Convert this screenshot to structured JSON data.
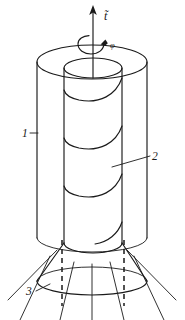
{
  "figure": {
    "caption": "",
    "background_color": "#ffffff",
    "ink_color": "#1a1a1a",
    "width_px": 185,
    "height_px": 320
  },
  "vector": {
    "symbol": "t",
    "accent": "tilde",
    "label": "t̃",
    "name": "axial-vector-t",
    "direction": "up",
    "arrow_tip_y": 8,
    "arrow_base_y": 62
  },
  "rotation": {
    "symbol": "φ",
    "label": "φ",
    "name": "rotation-angle-phi",
    "description": "curved arrow about the vertical axis"
  },
  "callouts": [
    {
      "id": "1",
      "label": "1",
      "name": "callout-1-outer-cylinder",
      "refers_to": "outer cylinder wall",
      "text_x": 22,
      "text_y": 137,
      "leader_from": [
        30,
        133
      ],
      "leader_to": [
        38,
        133
      ]
    },
    {
      "id": "2",
      "label": "2",
      "name": "callout-2-helical-band",
      "refers_to": "helical band on inner cylinder",
      "text_x": 152,
      "text_y": 160,
      "leader_from": [
        150,
        156
      ],
      "leader_to": [
        112,
        167
      ]
    },
    {
      "id": "3",
      "label": "3",
      "name": "callout-3-flow-lines",
      "refers_to": "radiating flow lines below skirt",
      "text_x": 28,
      "text_y": 295,
      "leader_from": [
        36,
        291
      ],
      "leader_to": [
        50,
        285
      ]
    }
  ],
  "geometry": {
    "outer_cylinder": {
      "name": "outer-cylinder",
      "left_x": 37,
      "right_x": 147,
      "center_x": 92,
      "top_y": 62,
      "bottom_y": 240,
      "ellipse_ry": 17
    },
    "inner_cylinder": {
      "name": "inner-cylinder",
      "left_x": 64,
      "right_x": 122,
      "center_x": 93,
      "top_y": 68,
      "bottom_y": 245,
      "ellipse_ry": 10
    },
    "skirt": {
      "name": "conical-skirt",
      "top_y": 243,
      "bottom_y": 283,
      "bottom_left_x": 37,
      "bottom_right_x": 147,
      "bottom_ry": 14
    },
    "helix": {
      "name": "helical-bands",
      "turns": 3
    },
    "dashed_verticals": {
      "count": 2,
      "x_positions": [
        62,
        124
      ],
      "top_y": 243,
      "bottom_y": 305
    },
    "radiating_lines": {
      "count": 7
    }
  }
}
